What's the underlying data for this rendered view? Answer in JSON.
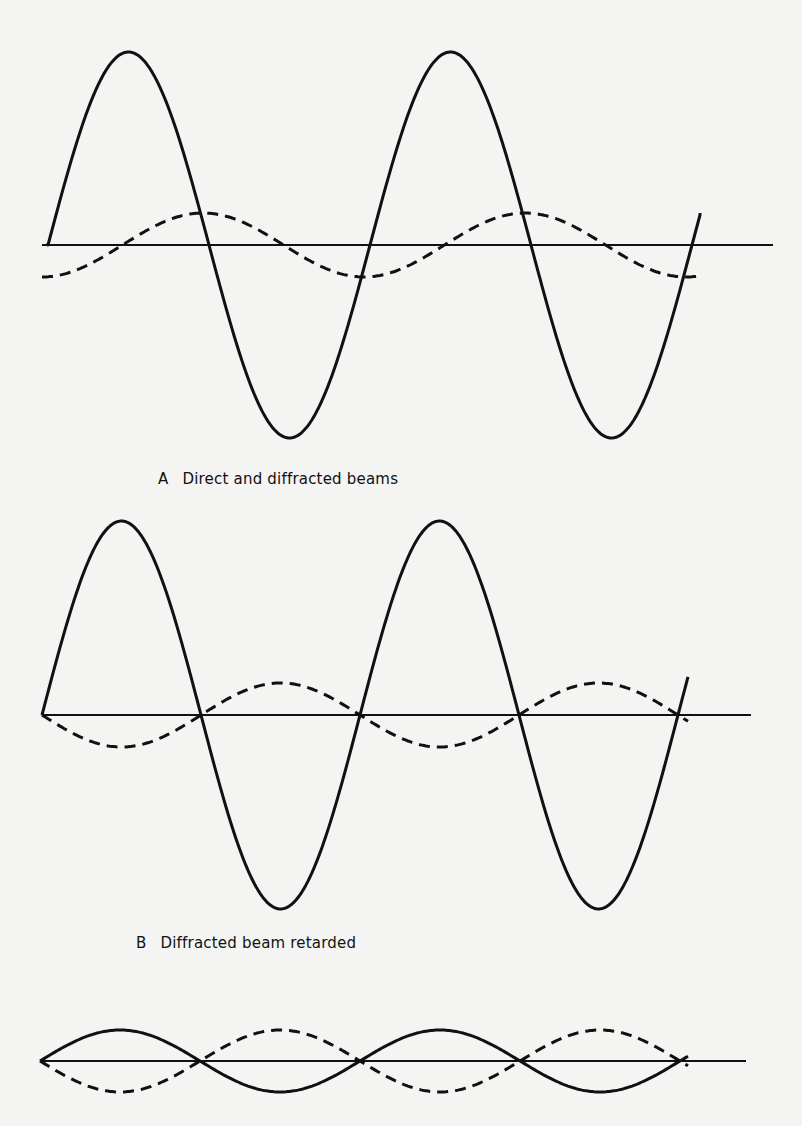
{
  "figure": {
    "colors": {
      "ink": "#111111",
      "paper": "#f4f4f2"
    },
    "panels": [
      {
        "id": "A",
        "letter": "A",
        "caption": "Direct and diffracted beams",
        "baseline": {
          "x1": 42,
          "x2": 773,
          "y": 245
        },
        "solid": {
          "x0": 48,
          "x_end": 700,
          "y0": 245,
          "amplitude": 193,
          "period": 322,
          "phase": 0,
          "start_y": 243,
          "end_y": 213
        },
        "dashed": {
          "x0": 42,
          "x_end": 700,
          "y0": 245,
          "amplitude": 32,
          "period": 322,
          "phase": -0.25
        }
      },
      {
        "id": "B",
        "letter": "B",
        "caption": "Diffracted beam retarded",
        "baseline": {
          "x1": 42,
          "x2": 751,
          "y": 715
        },
        "solid": {
          "x0": 42,
          "x_end": 688,
          "y0": 715,
          "amplitude": 194,
          "period": 318,
          "phase": 0
        },
        "dashed": {
          "x0": 42,
          "x_end": 688,
          "y0": 715,
          "amplitude": 32,
          "period": 318,
          "phase": 0.5
        }
      },
      {
        "id": "C",
        "letter": "",
        "caption": "",
        "baseline": {
          "x1": 40,
          "x2": 746,
          "y": 1061
        },
        "solid": {
          "x0": 40,
          "x_end": 688,
          "y0": 1061,
          "amplitude": 31,
          "period": 320,
          "phase": 0
        },
        "dashed": {
          "x0": 40,
          "x_end": 688,
          "y0": 1061,
          "amplitude": 31,
          "period": 320,
          "phase": 0.5
        }
      }
    ],
    "legend_semantics": {
      "solid": "direct beam",
      "dashed": "diffracted beam"
    }
  },
  "captions": {
    "a_letter": "A",
    "a_text": "Direct and diffracted beams",
    "b_letter": "B",
    "b_text": "Diffracted beam retarded"
  }
}
